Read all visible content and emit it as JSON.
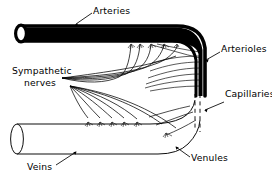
{
  "figure": {
    "type": "anatomical-line-diagram",
    "width": 272,
    "height": 177,
    "background_color": "#ffffff",
    "ink_color": "#000000"
  },
  "labels": {
    "arteries": "Arteries",
    "arterioles": "Arterioles",
    "capillaries": "Capillaries",
    "venules": "Venules",
    "veins": "Veins",
    "sympathetic_line1": "Sympathetic",
    "sympathetic_line2": "nerves"
  },
  "structures": [
    {
      "name": "artery",
      "label": "Arteries",
      "style": "thick-filled-tube",
      "stroke_color": "#000000",
      "description": "Large thick-walled vessel entering from upper left, curving down at right into arterioles"
    },
    {
      "name": "arterioles",
      "label": "Arterioles",
      "style": "thin-lines",
      "stroke_color": "#000000",
      "description": "Converging thin branches off the descending artery on the right"
    },
    {
      "name": "capillaries",
      "label": "Capillaries",
      "style": "vertical-dashed",
      "stroke_color": "#000000",
      "description": "Dashed vertical segment linking arterioles to venules"
    },
    {
      "name": "venules",
      "label": "Venules",
      "style": "thin-lines",
      "stroke_color": "#000000",
      "description": "Thin branches fanning left from the capillary bed into the vein"
    },
    {
      "name": "vein",
      "label": "Veins",
      "style": "thin-outline-tube",
      "stroke_color": "#000000",
      "description": "Large thin-walled vessel exiting to the lower left"
    },
    {
      "name": "sympathetic-nerves",
      "label": "Sympathetic nerves",
      "style": "fanned-fibers-with-terminals",
      "stroke_color": "#000000",
      "description": "Two fans of nerve fibers from the left, terminating in root-like endings on the artery wall and on the vein wall"
    }
  ]
}
